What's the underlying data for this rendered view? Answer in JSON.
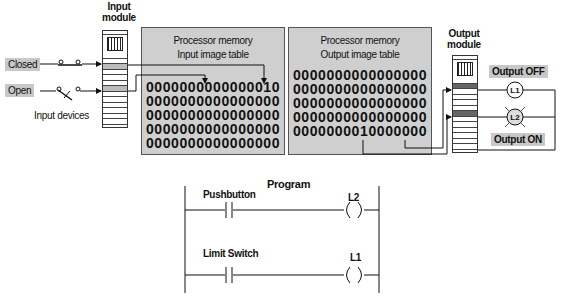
{
  "input_side": {
    "module_label_line1": "Input",
    "module_label_line2": "module",
    "closed_label": "Closed",
    "open_label": "Open",
    "devices_label": "Input devices"
  },
  "input_memory": {
    "title_line1": "Processor memory",
    "title_line2": "Input image table",
    "rows": [
      "0000000000000010",
      "0000000000000000",
      "0000000000000000",
      "0000000000000000",
      "0000000000000000"
    ]
  },
  "output_memory": {
    "title_line1": "Processor memory",
    "title_line2": "Output image table",
    "rows": [
      "0000000000000000",
      "0000000000000000",
      "0000000000000000",
      "0000000000000000",
      "0000000010000000"
    ]
  },
  "output_side": {
    "module_label_line1": "Output",
    "module_label_line2": "module",
    "output_off_label": "Output OFF",
    "output_on_label": "Output ON",
    "lamp1": "L1",
    "lamp2": "L2"
  },
  "program": {
    "title": "Program",
    "rung1": {
      "contact_label": "Pushbutton",
      "coil_label": "L2"
    },
    "rung2": {
      "contact_label": "Limit Switch",
      "coil_label": "L1"
    }
  }
}
